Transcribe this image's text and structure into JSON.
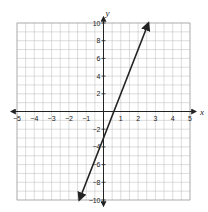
{
  "chart_data": {
    "type": "line",
    "title": "",
    "xlabel": "x",
    "ylabel": "y",
    "xlim": [
      -5,
      5
    ],
    "ylim": [
      -10,
      10
    ],
    "grid": true,
    "x_ticks": [
      -5,
      -4,
      -3,
      -2,
      -1,
      1,
      2,
      3,
      4,
      5
    ],
    "y_ticks": [
      -10,
      -8,
      -6,
      -4,
      -2,
      2,
      4,
      6,
      8,
      10
    ],
    "series": [
      {
        "name": "line",
        "equation": "y = 5x - 3",
        "x": [
          -1.4,
          2.6
        ],
        "y": [
          -10,
          10
        ],
        "arrows": "both",
        "color": "#222222"
      }
    ]
  },
  "labels": {
    "x_axis": "x",
    "y_axis": "y",
    "x_ticks": [
      "−5",
      "−4",
      "−3",
      "−2",
      "−1",
      "1",
      "2",
      "3",
      "4",
      "5"
    ],
    "y_ticks": [
      "10",
      "8",
      "6",
      "4",
      "2",
      "−2",
      "−4",
      "−6",
      "−8",
      "−10"
    ]
  }
}
